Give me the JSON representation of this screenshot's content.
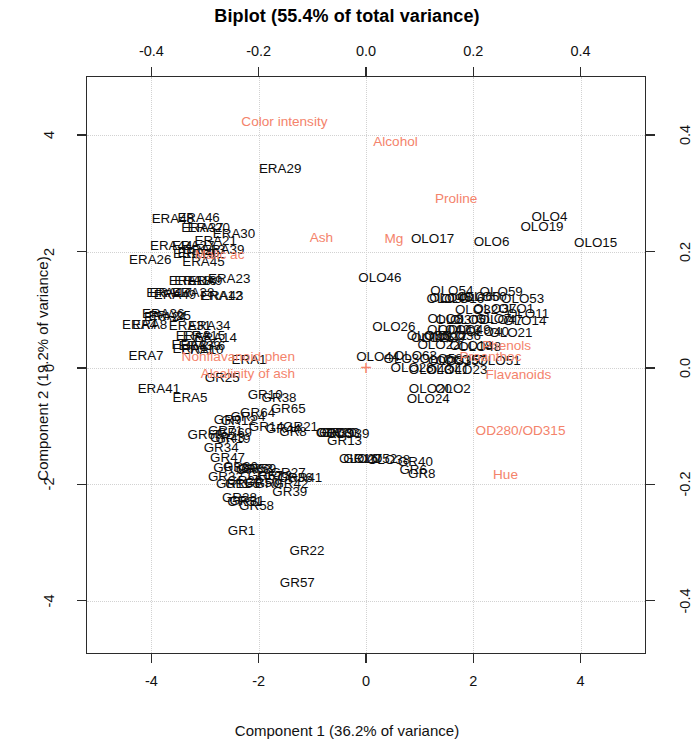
{
  "chart_data": {
    "type": "scatter",
    "title": "Biplot (55.4% of total variance)",
    "xlabel": "Component 1 (36.2% of variance)",
    "ylabel": "Component 2 (19.2% of variance)",
    "grid": true,
    "legend": null,
    "xlim": [
      -5.2,
      5.2
    ],
    "ylim": [
      -4.9,
      5.0
    ],
    "xticks": [
      "-4",
      "-2",
      "0",
      "2",
      "4"
    ],
    "xtick_values": [
      -4,
      -2,
      0,
      2,
      4
    ],
    "yticks": [
      "-4",
      "-2",
      "0",
      "2",
      "4"
    ],
    "ytick_values": [
      -4,
      -2,
      0,
      2,
      4
    ],
    "x2lim": [
      -0.52,
      0.52
    ],
    "y2lim": [
      -0.49,
      0.5
    ],
    "x2ticks": [
      "-0.4",
      "-0.2",
      "0.0",
      "0.2",
      "0.4"
    ],
    "x2tick_values": [
      -0.4,
      -0.2,
      0.0,
      0.2,
      0.4
    ],
    "y2ticks": [
      "0.4",
      "0.2",
      "0.0",
      "-0.2",
      "-0.4"
    ],
    "y2tick_values": [
      0.4,
      0.2,
      0.0,
      -0.2,
      -0.4
    ],
    "origin_marker": "+",
    "colors": {
      "points": "#0d0d0d",
      "variables": "#f4836b",
      "frame": "#2b2b2b",
      "grid": "#d2d2d2"
    },
    "variables": [
      {
        "label": "Color intensity",
        "x": -1.52,
        "y": 4.22
      },
      {
        "label": "Alcohol",
        "x": 0.55,
        "y": 3.88
      },
      {
        "label": "Proline",
        "x": 1.68,
        "y": 2.9
      },
      {
        "label": "Ash",
        "x": -0.83,
        "y": 2.24
      },
      {
        "label": "Mg",
        "x": 0.52,
        "y": 2.22
      },
      {
        "label": "Malic ac",
        "x": -2.73,
        "y": 1.94
      },
      {
        "label": "Phenols",
        "x": 2.62,
        "y": 0.37
      },
      {
        "label": "Proanthoc",
        "x": 2.32,
        "y": 0.18
      },
      {
        "label": "Flavanoids",
        "x": 2.84,
        "y": -0.12
      },
      {
        "label": "Nonflavanoid phen",
        "x": -2.38,
        "y": 0.18
      },
      {
        "label": "Alcalinity of ash",
        "x": -2.2,
        "y": -0.11
      },
      {
        "label": "OD280/OD315",
        "x": 2.88,
        "y": -1.08
      },
      {
        "label": "Hue",
        "x": 2.6,
        "y": -1.84
      }
    ],
    "points": [
      {
        "label": "ERA48",
        "x": -3.6,
        "y": 2.56
      },
      {
        "label": "ERA46",
        "x": -3.12,
        "y": 2.57
      },
      {
        "label": "ERA30",
        "x": -2.46,
        "y": 2.3
      },
      {
        "label": "ERA37",
        "x": -3.05,
        "y": 2.4
      },
      {
        "label": "ERA20",
        "x": -2.93,
        "y": 2.4
      },
      {
        "label": "ERA21",
        "x": -2.8,
        "y": 2.18
      },
      {
        "label": "ERA44",
        "x": -3.63,
        "y": 2.1
      },
      {
        "label": "ERA39",
        "x": -2.66,
        "y": 2.03
      },
      {
        "label": "ERA27",
        "x": -3.22,
        "y": 2.1
      },
      {
        "label": "ERA13",
        "x": -3.02,
        "y": 2.02
      },
      {
        "label": "ERA40",
        "x": -3.12,
        "y": 1.98
      },
      {
        "label": "ERA19",
        "x": -3.2,
        "y": 1.96
      },
      {
        "label": "ERA26",
        "x": -4.02,
        "y": 1.86
      },
      {
        "label": "ERA45",
        "x": -3.03,
        "y": 1.82
      },
      {
        "label": "ERA23",
        "x": -2.55,
        "y": 1.52
      },
      {
        "label": "ERA29",
        "x": -1.6,
        "y": 3.42
      },
      {
        "label": "ERA18",
        "x": -3.28,
        "y": 1.5
      },
      {
        "label": "ERA16",
        "x": -3.18,
        "y": 1.5
      },
      {
        "label": "ERA9",
        "x": -3.0,
        "y": 1.49
      },
      {
        "label": "ERA38",
        "x": -3.22,
        "y": 1.28
      },
      {
        "label": "ERA47",
        "x": -3.7,
        "y": 1.28
      },
      {
        "label": "ERA49",
        "x": -3.56,
        "y": 1.26
      },
      {
        "label": "ERA17",
        "x": -3.64,
        "y": 1.29
      },
      {
        "label": "ERA12",
        "x": -2.7,
        "y": 1.24
      },
      {
        "label": "ERA43",
        "x": -2.68,
        "y": 1.24
      },
      {
        "label": "ERA36",
        "x": -3.78,
        "y": 0.92
      },
      {
        "label": "ERA25",
        "x": -3.66,
        "y": 0.9
      },
      {
        "label": "ERA24",
        "x": -3.74,
        "y": 0.88
      },
      {
        "label": "ERA8",
        "x": -4.03,
        "y": 0.74
      },
      {
        "label": "ERA4",
        "x": -4.22,
        "y": 0.74
      },
      {
        "label": "ERA31",
        "x": -3.28,
        "y": 0.72
      },
      {
        "label": "ERA34",
        "x": -2.92,
        "y": 0.72
      },
      {
        "label": "ERA3",
        "x": -3.22,
        "y": 0.55
      },
      {
        "label": "ERA15",
        "x": -3.02,
        "y": 0.55
      },
      {
        "label": "ERA14",
        "x": -2.8,
        "y": 0.52
      },
      {
        "label": "ERA2",
        "x": -3.3,
        "y": 0.4
      },
      {
        "label": "ERA33",
        "x": -3.1,
        "y": 0.38
      },
      {
        "label": "ERA6",
        "x": -2.95,
        "y": 0.38
      },
      {
        "label": "ERA11",
        "x": -3.22,
        "y": 0.33
      },
      {
        "label": "ERA10",
        "x": -3.05,
        "y": 0.3
      },
      {
        "label": "ERA7",
        "x": -4.1,
        "y": 0.2
      },
      {
        "label": "ERA1",
        "x": -2.18,
        "y": 0.14
      },
      {
        "label": "ERA41",
        "x": -3.86,
        "y": -0.36
      },
      {
        "label": "ERA5",
        "x": -3.28,
        "y": -0.52
      },
      {
        "label": "GR25",
        "x": -2.68,
        "y": -0.18
      },
      {
        "label": "GR10",
        "x": -1.88,
        "y": -0.46
      },
      {
        "label": "GR38",
        "x": -1.62,
        "y": -0.52
      },
      {
        "label": "GR65",
        "x": -1.45,
        "y": -0.7
      },
      {
        "label": "GR64",
        "x": -2.02,
        "y": -0.78
      },
      {
        "label": "GR54",
        "x": -2.2,
        "y": -0.84
      },
      {
        "label": "GR12",
        "x": -2.38,
        "y": -0.92
      },
      {
        "label": "GR9",
        "x": -2.58,
        "y": -0.9
      },
      {
        "label": "GR14",
        "x": -1.86,
        "y": -1.02
      },
      {
        "label": "GR44",
        "x": -1.54,
        "y": -1.05
      },
      {
        "label": "GR21",
        "x": -1.22,
        "y": -1.02
      },
      {
        "label": "GR8",
        "x": -1.36,
        "y": -1.1
      },
      {
        "label": "GR71",
        "x": -2.62,
        "y": -1.08
      },
      {
        "label": "GR69",
        "x": -2.45,
        "y": -1.12
      },
      {
        "label": "GR60",
        "x": -3.0,
        "y": -1.16
      },
      {
        "label": "GR19",
        "x": -2.48,
        "y": -1.22
      },
      {
        "label": "GR43",
        "x": -2.58,
        "y": -1.2
      },
      {
        "label": "GR34",
        "x": -2.7,
        "y": -1.38
      },
      {
        "label": "GR47",
        "x": -2.58,
        "y": -1.55
      },
      {
        "label": "GR33",
        "x": -2.52,
        "y": -1.72
      },
      {
        "label": "GR30",
        "x": -2.34,
        "y": -1.7
      },
      {
        "label": "GR59",
        "x": -2.0,
        "y": -1.74
      },
      {
        "label": "GR53",
        "x": -2.06,
        "y": -1.74
      },
      {
        "label": "GR68",
        "x": -2.1,
        "y": -1.75
      },
      {
        "label": "GR32",
        "x": -2.62,
        "y": -1.88
      },
      {
        "label": "GR67",
        "x": -1.88,
        "y": -1.86
      },
      {
        "label": "GR18",
        "x": -1.7,
        "y": -1.85
      },
      {
        "label": "GR27",
        "x": -1.45,
        "y": -1.8
      },
      {
        "label": "GR41",
        "x": -1.14,
        "y": -1.9
      },
      {
        "label": "GR36",
        "x": -1.32,
        "y": -1.9
      },
      {
        "label": "GR26",
        "x": -2.26,
        "y": -1.94
      },
      {
        "label": "GR50",
        "x": -1.94,
        "y": -1.98
      },
      {
        "label": "GR9b",
        "x": -1.82,
        "y": -2.0
      },
      {
        "label": "GR42",
        "x": -1.4,
        "y": -2.0
      },
      {
        "label": "GR11",
        "x": -2.48,
        "y": -2.0
      },
      {
        "label": "GR55",
        "x": -2.3,
        "y": -1.99
      },
      {
        "label": "GR39",
        "x": -1.42,
        "y": -2.14
      },
      {
        "label": "GR28",
        "x": -2.36,
        "y": -2.24
      },
      {
        "label": "GR31",
        "x": -2.22,
        "y": -2.28
      },
      {
        "label": "GR51",
        "x": -2.26,
        "y": -2.3
      },
      {
        "label": "GR58",
        "x": -2.04,
        "y": -2.38
      },
      {
        "label": "GR1",
        "x": -2.32,
        "y": -2.8
      },
      {
        "label": "GR22",
        "x": -1.1,
        "y": -3.14
      },
      {
        "label": "GR57",
        "x": -1.28,
        "y": -3.7
      },
      {
        "label": "GR13",
        "x": -0.4,
        "y": -1.25
      },
      {
        "label": "GR39b",
        "x": -0.55,
        "y": -1.12
      },
      {
        "label": "GR20",
        "x": -0.5,
        "y": -1.12
      },
      {
        "label": "GR7",
        "x": -0.68,
        "y": -1.12
      },
      {
        "label": "GR16",
        "x": -0.1,
        "y": -1.56
      },
      {
        "label": "GR40",
        "x": 0.92,
        "y": -1.62
      },
      {
        "label": "GR8b",
        "x": 1.04,
        "y": -1.82
      },
      {
        "label": "GR6",
        "x": 0.88,
        "y": -1.76
      },
      {
        "label": "OLO46",
        "x": 0.26,
        "y": 1.54
      },
      {
        "label": "OLO17",
        "x": 1.24,
        "y": 2.22
      },
      {
        "label": "OLO6",
        "x": 2.34,
        "y": 2.16
      },
      {
        "label": "OLO4",
        "x": 3.42,
        "y": 2.6
      },
      {
        "label": "OLO19",
        "x": 3.28,
        "y": 2.42
      },
      {
        "label": "OLO15",
        "x": 4.28,
        "y": 2.14
      },
      {
        "label": "OLO54",
        "x": 1.6,
        "y": 1.32
      },
      {
        "label": "OLO59",
        "x": 2.52,
        "y": 1.3
      },
      {
        "label": "OLO53",
        "x": 2.92,
        "y": 1.18
      },
      {
        "label": "OLO16",
        "x": 1.8,
        "y": 1.18
      },
      {
        "label": "OLO9",
        "x": 1.46,
        "y": 1.18
      },
      {
        "label": "OLO45",
        "x": 1.58,
        "y": 1.2
      },
      {
        "label": "OLO60",
        "x": 2.1,
        "y": 1.22
      },
      {
        "label": "OLO50",
        "x": 2.22,
        "y": 1.22
      },
      {
        "label": "OLO1",
        "x": 2.8,
        "y": 1.02
      },
      {
        "label": "OLO37",
        "x": 2.4,
        "y": 1.02
      },
      {
        "label": "OLO32",
        "x": 2.06,
        "y": 1.0
      },
      {
        "label": "OLO11",
        "x": 3.02,
        "y": 0.92
      },
      {
        "label": "OLO14",
        "x": 2.96,
        "y": 0.8
      },
      {
        "label": "OLO7",
        "x": 2.38,
        "y": 0.84
      },
      {
        "label": "OLO47",
        "x": 2.52,
        "y": 0.82
      },
      {
        "label": "OLO8",
        "x": 1.48,
        "y": 0.84
      },
      {
        "label": "OLO30",
        "x": 1.7,
        "y": 0.82
      },
      {
        "label": "OLO5",
        "x": 1.9,
        "y": 0.82
      },
      {
        "label": "OLO42",
        "x": 1.54,
        "y": 0.66
      },
      {
        "label": "OLO13",
        "x": 1.74,
        "y": 0.66
      },
      {
        "label": "OLO49",
        "x": 1.92,
        "y": 0.66
      },
      {
        "label": "OLO21",
        "x": 2.7,
        "y": 0.6
      },
      {
        "label": "OLO40",
        "x": 2.26,
        "y": 0.62
      },
      {
        "label": "OLO26",
        "x": 0.52,
        "y": 0.7
      },
      {
        "label": "OLO55",
        "x": 1.16,
        "y": 0.54
      },
      {
        "label": "OLO12",
        "x": 1.48,
        "y": 0.54
      },
      {
        "label": "OLO36",
        "x": 1.74,
        "y": 0.54
      },
      {
        "label": "OLO25",
        "x": 1.24,
        "y": 0.52
      },
      {
        "label": "OLO29",
        "x": 1.44,
        "y": 0.52
      },
      {
        "label": "OLO22",
        "x": 1.36,
        "y": 0.4
      },
      {
        "label": "OLO18",
        "x": 1.96,
        "y": 0.38
      },
      {
        "label": "OLO48",
        "x": 2.12,
        "y": 0.36
      },
      {
        "label": "OLO44",
        "x": 0.22,
        "y": 0.18
      },
      {
        "label": "OLO63",
        "x": 0.92,
        "y": 0.2
      },
      {
        "label": "OLO3",
        "x": 0.66,
        "y": 0.16
      },
      {
        "label": "OLO58",
        "x": 1.4,
        "y": 0.16
      },
      {
        "label": "OLO57",
        "x": 1.84,
        "y": 0.14
      },
      {
        "label": "OLO51",
        "x": 2.48,
        "y": 0.12
      },
      {
        "label": "OLO31",
        "x": 1.56,
        "y": 0.12
      },
      {
        "label": "OLO35",
        "x": 1.7,
        "y": 0.12
      },
      {
        "label": "OLO28",
        "x": 0.86,
        "y": 0.0
      },
      {
        "label": "OLO41",
        "x": 1.52,
        "y": -0.04
      },
      {
        "label": "OLO23",
        "x": 1.86,
        "y": -0.04
      },
      {
        "label": "OLO43",
        "x": 1.2,
        "y": -0.04
      },
      {
        "label": "OLO20",
        "x": 1.2,
        "y": -0.36
      },
      {
        "label": "OLO2",
        "x": 1.62,
        "y": -0.36
      },
      {
        "label": "OLO24",
        "x": 1.16,
        "y": -0.54
      },
      {
        "label": "OLO39",
        "x": -0.34,
        "y": -1.14
      },
      {
        "label": "OLO33",
        "x": -0.52,
        "y": -1.12
      },
      {
        "label": "OLO27",
        "x": -0.1,
        "y": -1.56
      },
      {
        "label": "OLO38",
        "x": 0.42,
        "y": -1.58
      },
      {
        "label": "OLO52",
        "x": 0.18,
        "y": -1.56
      }
    ]
  }
}
